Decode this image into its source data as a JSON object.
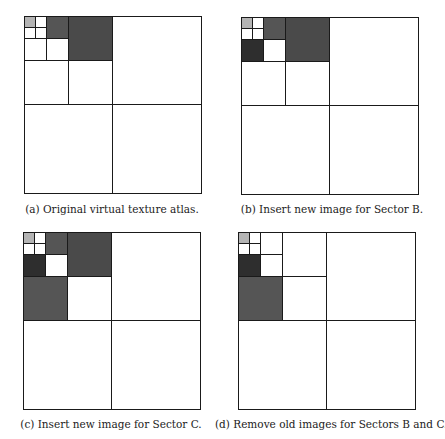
{
  "figure": {
    "atlas_size_px": 177,
    "colors": {
      "white": "#ffffff",
      "light_gray": "#b4b4b4",
      "medium_dark": "#555555",
      "dark": "#4a4a4a",
      "very_dark": "#2e2e2e",
      "line": "#1a1a1a"
    },
    "panels": [
      {
        "id": "a",
        "caption": "(a) Original virtual texture atlas.",
        "origin": [
          24,
          16
        ],
        "caption_pos": [
          2,
          203
        ],
        "cells": [
          {
            "x": 0,
            "y": 0,
            "s": 11,
            "fill": "light_gray"
          },
          {
            "x": 11,
            "y": 0,
            "s": 11,
            "fill": "white"
          },
          {
            "x": 0,
            "y": 11,
            "s": 11,
            "fill": "white"
          },
          {
            "x": 11,
            "y": 11,
            "s": 11,
            "fill": "white"
          },
          {
            "x": 22,
            "y": 0,
            "s": 22,
            "fill": "medium_dark"
          },
          {
            "x": 0,
            "y": 22,
            "s": 22,
            "fill": "white"
          },
          {
            "x": 22,
            "y": 22,
            "s": 22,
            "fill": "white"
          },
          {
            "x": 44,
            "y": 0,
            "s": 44,
            "fill": "dark"
          },
          {
            "x": 0,
            "y": 44,
            "s": 44,
            "fill": "white"
          },
          {
            "x": 44,
            "y": 44,
            "s": 44,
            "fill": "white"
          },
          {
            "x": 88,
            "y": 0,
            "s": 89,
            "fill": "white"
          },
          {
            "x": 0,
            "y": 88,
            "s": 89,
            "fill": "white"
          },
          {
            "x": 88,
            "y": 88,
            "s": 89,
            "fill": "white"
          }
        ]
      },
      {
        "id": "b",
        "caption": "(b) Insert new image for Sector B.",
        "origin": [
          241,
          17
        ],
        "caption_pos": [
          222,
          203
        ],
        "cells": [
          {
            "x": 0,
            "y": 0,
            "s": 11,
            "fill": "light_gray"
          },
          {
            "x": 11,
            "y": 0,
            "s": 11,
            "fill": "white"
          },
          {
            "x": 0,
            "y": 11,
            "s": 11,
            "fill": "white"
          },
          {
            "x": 11,
            "y": 11,
            "s": 11,
            "fill": "white"
          },
          {
            "x": 22,
            "y": 0,
            "s": 22,
            "fill": "medium_dark"
          },
          {
            "x": 0,
            "y": 22,
            "s": 22,
            "fill": "very_dark"
          },
          {
            "x": 22,
            "y": 22,
            "s": 22,
            "fill": "white"
          },
          {
            "x": 44,
            "y": 0,
            "s": 44,
            "fill": "dark"
          },
          {
            "x": 0,
            "y": 44,
            "s": 44,
            "fill": "white"
          },
          {
            "x": 44,
            "y": 44,
            "s": 44,
            "fill": "white"
          },
          {
            "x": 88,
            "y": 0,
            "s": 89,
            "fill": "white"
          },
          {
            "x": 0,
            "y": 88,
            "s": 89,
            "fill": "white"
          },
          {
            "x": 88,
            "y": 88,
            "s": 89,
            "fill": "white"
          }
        ]
      },
      {
        "id": "c",
        "caption": "(c) Insert new image for Sector C.",
        "origin": [
          23,
          232
        ],
        "caption_pos": [
          1,
          418
        ],
        "cells": [
          {
            "x": 0,
            "y": 0,
            "s": 11,
            "fill": "light_gray"
          },
          {
            "x": 11,
            "y": 0,
            "s": 11,
            "fill": "white"
          },
          {
            "x": 0,
            "y": 11,
            "s": 11,
            "fill": "white"
          },
          {
            "x": 11,
            "y": 11,
            "s": 11,
            "fill": "white"
          },
          {
            "x": 22,
            "y": 0,
            "s": 22,
            "fill": "medium_dark"
          },
          {
            "x": 0,
            "y": 22,
            "s": 22,
            "fill": "very_dark"
          },
          {
            "x": 22,
            "y": 22,
            "s": 22,
            "fill": "white"
          },
          {
            "x": 44,
            "y": 0,
            "s": 44,
            "fill": "dark"
          },
          {
            "x": 0,
            "y": 44,
            "s": 44,
            "fill": "medium_dark"
          },
          {
            "x": 44,
            "y": 44,
            "s": 44,
            "fill": "white"
          },
          {
            "x": 88,
            "y": 0,
            "s": 89,
            "fill": "white"
          },
          {
            "x": 0,
            "y": 88,
            "s": 89,
            "fill": "white"
          },
          {
            "x": 88,
            "y": 88,
            "s": 89,
            "fill": "white"
          }
        ]
      },
      {
        "id": "d",
        "caption": "(d) Remove old images for Sectors B and C.",
        "origin": [
          238,
          232
        ],
        "caption_pos": [
          215,
          418
        ],
        "cells": [
          {
            "x": 0,
            "y": 0,
            "s": 11,
            "fill": "light_gray"
          },
          {
            "x": 11,
            "y": 0,
            "s": 11,
            "fill": "white"
          },
          {
            "x": 0,
            "y": 11,
            "s": 11,
            "fill": "white"
          },
          {
            "x": 11,
            "y": 11,
            "s": 11,
            "fill": "white"
          },
          {
            "x": 22,
            "y": 0,
            "s": 22,
            "fill": "white"
          },
          {
            "x": 0,
            "y": 22,
            "s": 22,
            "fill": "very_dark"
          },
          {
            "x": 22,
            "y": 22,
            "s": 22,
            "fill": "white"
          },
          {
            "x": 44,
            "y": 0,
            "s": 44,
            "fill": "white"
          },
          {
            "x": 0,
            "y": 44,
            "s": 44,
            "fill": "medium_dark"
          },
          {
            "x": 44,
            "y": 44,
            "s": 44,
            "fill": "white"
          },
          {
            "x": 88,
            "y": 0,
            "s": 89,
            "fill": "white"
          },
          {
            "x": 0,
            "y": 88,
            "s": 89,
            "fill": "white"
          },
          {
            "x": 88,
            "y": 88,
            "s": 89,
            "fill": "white"
          }
        ]
      }
    ]
  }
}
